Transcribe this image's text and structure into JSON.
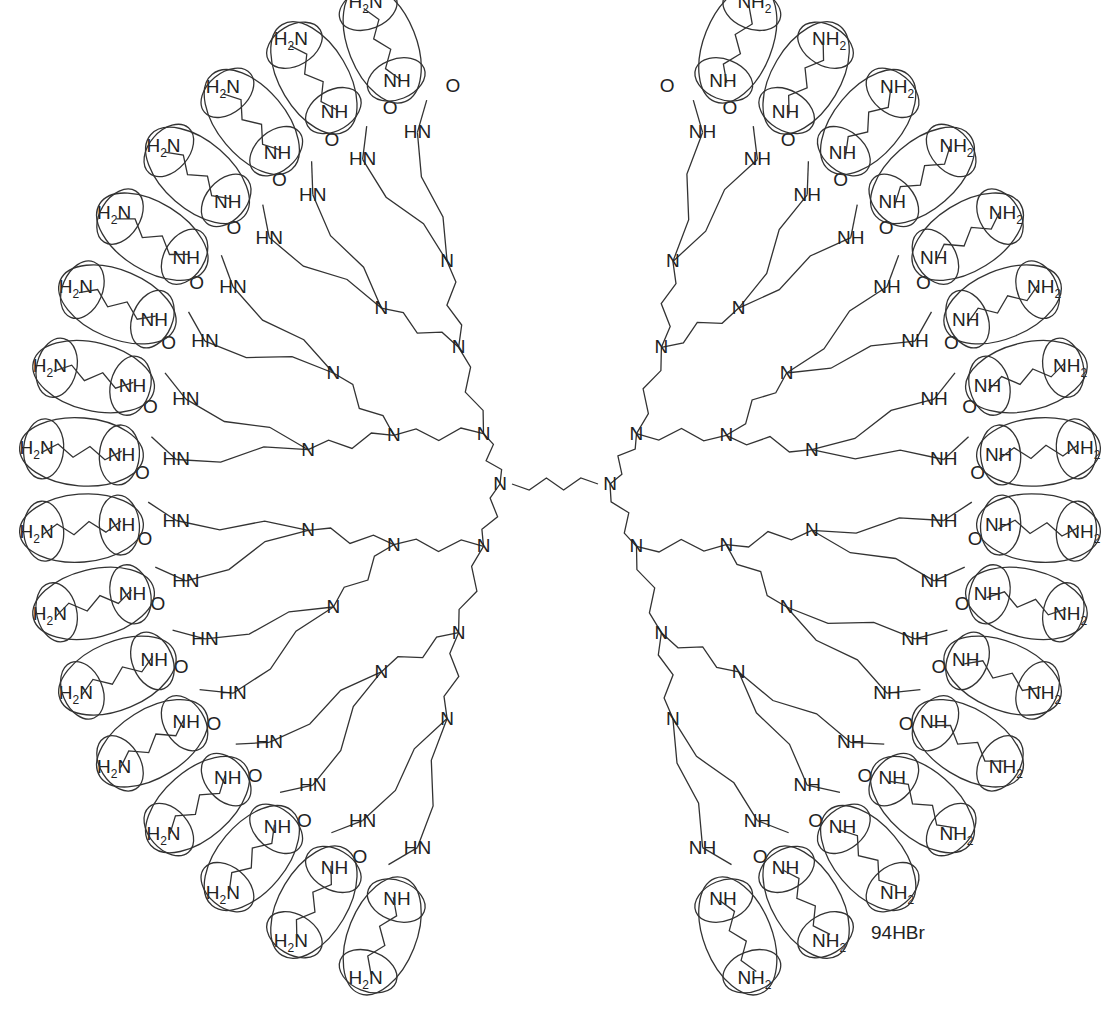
{
  "diagram": {
    "type": "chemical-structure",
    "counterion_label": "94HBr",
    "core": {
      "label_left": "N",
      "label_right": "N",
      "center": [
        560,
        490
      ],
      "linker": "butylene"
    },
    "labels": {
      "branch_nitrogen": "N",
      "amide_nh": "NH",
      "amide_hn": "HN",
      "carbonyl_o": "O",
      "terminal_amine": "H2N",
      "terminal_amine_alt": "NH2",
      "secondary_amine": "NH",
      "h": "H"
    },
    "generations": 4,
    "terminal_group_count": 32,
    "terminal_group": {
      "description": "ellipse-enclosed aminobutyl chain",
      "inner_label": "NH",
      "outer_label_left_half": "H2N",
      "outer_label_right_half": "NH2"
    },
    "colors": {
      "line": "#333333",
      "text": "#222222",
      "background": "#ffffff"
    }
  }
}
